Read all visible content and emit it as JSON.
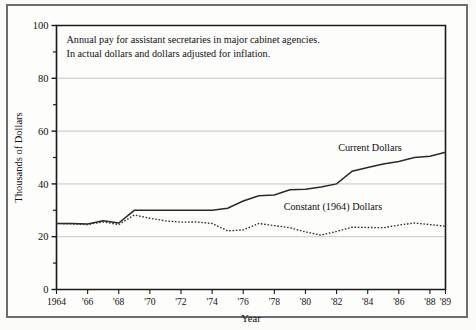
{
  "chart_data": {
    "type": "line",
    "title": "",
    "annotation_lines": [
      "Annual pay for assistant secretaries in major cabinet agencies.",
      "In actual dollars and dollars adjusted for inflation."
    ],
    "xlabel": "Year",
    "ylabel": "Thousands of Dollars",
    "xlim": [
      1964,
      1989
    ],
    "ylim": [
      0,
      100
    ],
    "y_ticks": [
      0,
      20,
      40,
      60,
      80,
      100
    ],
    "y_tick_labels": [
      "0",
      "20",
      "40",
      "60",
      "80",
      "100"
    ],
    "y_minor_ticks": [
      10,
      30,
      50,
      70,
      90
    ],
    "x_ticks": [
      1964,
      1966,
      1968,
      1970,
      1972,
      1974,
      1976,
      1978,
      1980,
      1982,
      1984,
      1986,
      1988,
      1989
    ],
    "x_tick_labels": [
      "1964",
      "'66",
      "'68",
      "'70",
      "'72",
      "'74",
      "'76",
      "'78",
      "'80",
      "'82",
      "'84",
      "'86",
      "'88",
      "'89"
    ],
    "grid": "horizontal-major",
    "legend_position": "inline-annotations",
    "x": [
      1964,
      1965,
      1966,
      1967,
      1968,
      1969,
      1970,
      1971,
      1972,
      1973,
      1974,
      1975,
      1976,
      1977,
      1978,
      1979,
      1980,
      1981,
      1982,
      1983,
      1984,
      1985,
      1986,
      1987,
      1988,
      1989
    ],
    "series": [
      {
        "name": "Current Dollars",
        "style": "solid",
        "color": "#2a2a2a",
        "label_x": 1982.1,
        "label_y": 52.5,
        "values": [
          25.0,
          25.0,
          24.8,
          26.0,
          25.2,
          30.0,
          30.0,
          30.0,
          30.0,
          30.0,
          30.0,
          30.8,
          33.5,
          35.5,
          35.8,
          37.8,
          38.0,
          38.8,
          40.0,
          44.8,
          46.2,
          47.5,
          48.5,
          50.0,
          50.5,
          52.0
        ]
      },
      {
        "name": "Constant (1964) Dollars",
        "style": "dotted",
        "color": "#2f2f2f",
        "label_x": 1978.6,
        "label_y": 30.0,
        "values": [
          25.0,
          24.8,
          24.6,
          25.6,
          24.6,
          28.2,
          27.0,
          26.0,
          25.5,
          25.6,
          25.0,
          22.2,
          22.6,
          25.0,
          24.2,
          23.4,
          21.8,
          20.6,
          22.0,
          23.6,
          23.5,
          23.4,
          24.4,
          25.2,
          24.6,
          24.0
        ]
      }
    ]
  }
}
